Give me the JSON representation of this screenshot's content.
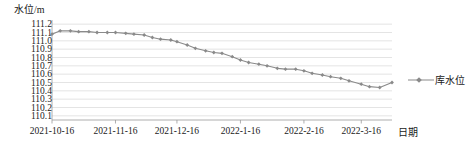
{
  "chart_data": {
    "type": "line",
    "title": "",
    "ylabel": "水位/m",
    "xlabel": "日期",
    "ylim": [
      110.05,
      111.25
    ],
    "yticks": [
      "110.1",
      "110.2",
      "110.3",
      "110.4",
      "110.5",
      "110.6",
      "110.7",
      "110.8",
      "110.9",
      "111.0",
      "111.1",
      "111.2"
    ],
    "ytick_values": [
      110.1,
      110.2,
      110.3,
      110.4,
      110.5,
      110.6,
      110.7,
      110.8,
      110.9,
      111.0,
      111.1,
      111.2
    ],
    "xtick_labels": [
      "2021-10-16",
      "2021-11-16",
      "2021-12-16",
      "2022-1-16",
      "2022-2-16",
      "2022-3-16"
    ],
    "xtick_positions": [
      0,
      31,
      61,
      92,
      123,
      151
    ],
    "xlim": [
      0,
      166
    ],
    "grid": "horizontal",
    "legend_position": "right",
    "series": [
      {
        "name": "库水位",
        "color": "#8a8a8a",
        "marker": "diamond",
        "x": [
          0,
          4,
          9,
          13,
          18,
          22,
          27,
          31,
          36,
          40,
          45,
          49,
          53,
          58,
          61,
          66,
          70,
          75,
          79,
          83,
          88,
          92,
          96,
          101,
          105,
          110,
          114,
          119,
          123,
          127,
          132,
          136,
          141,
          145,
          151,
          155,
          160,
          166
        ],
        "values": [
          111.08,
          111.12,
          111.12,
          111.11,
          111.11,
          111.1,
          111.1,
          111.1,
          111.09,
          111.08,
          111.07,
          111.04,
          111.02,
          111.01,
          110.99,
          110.95,
          110.91,
          110.88,
          110.86,
          110.85,
          110.81,
          110.77,
          110.74,
          110.72,
          110.7,
          110.67,
          110.66,
          110.66,
          110.64,
          110.61,
          110.59,
          110.57,
          110.55,
          110.52,
          110.48,
          110.45,
          110.44,
          110.5
        ]
      }
    ]
  },
  "legend": {
    "label": "库水位"
  }
}
